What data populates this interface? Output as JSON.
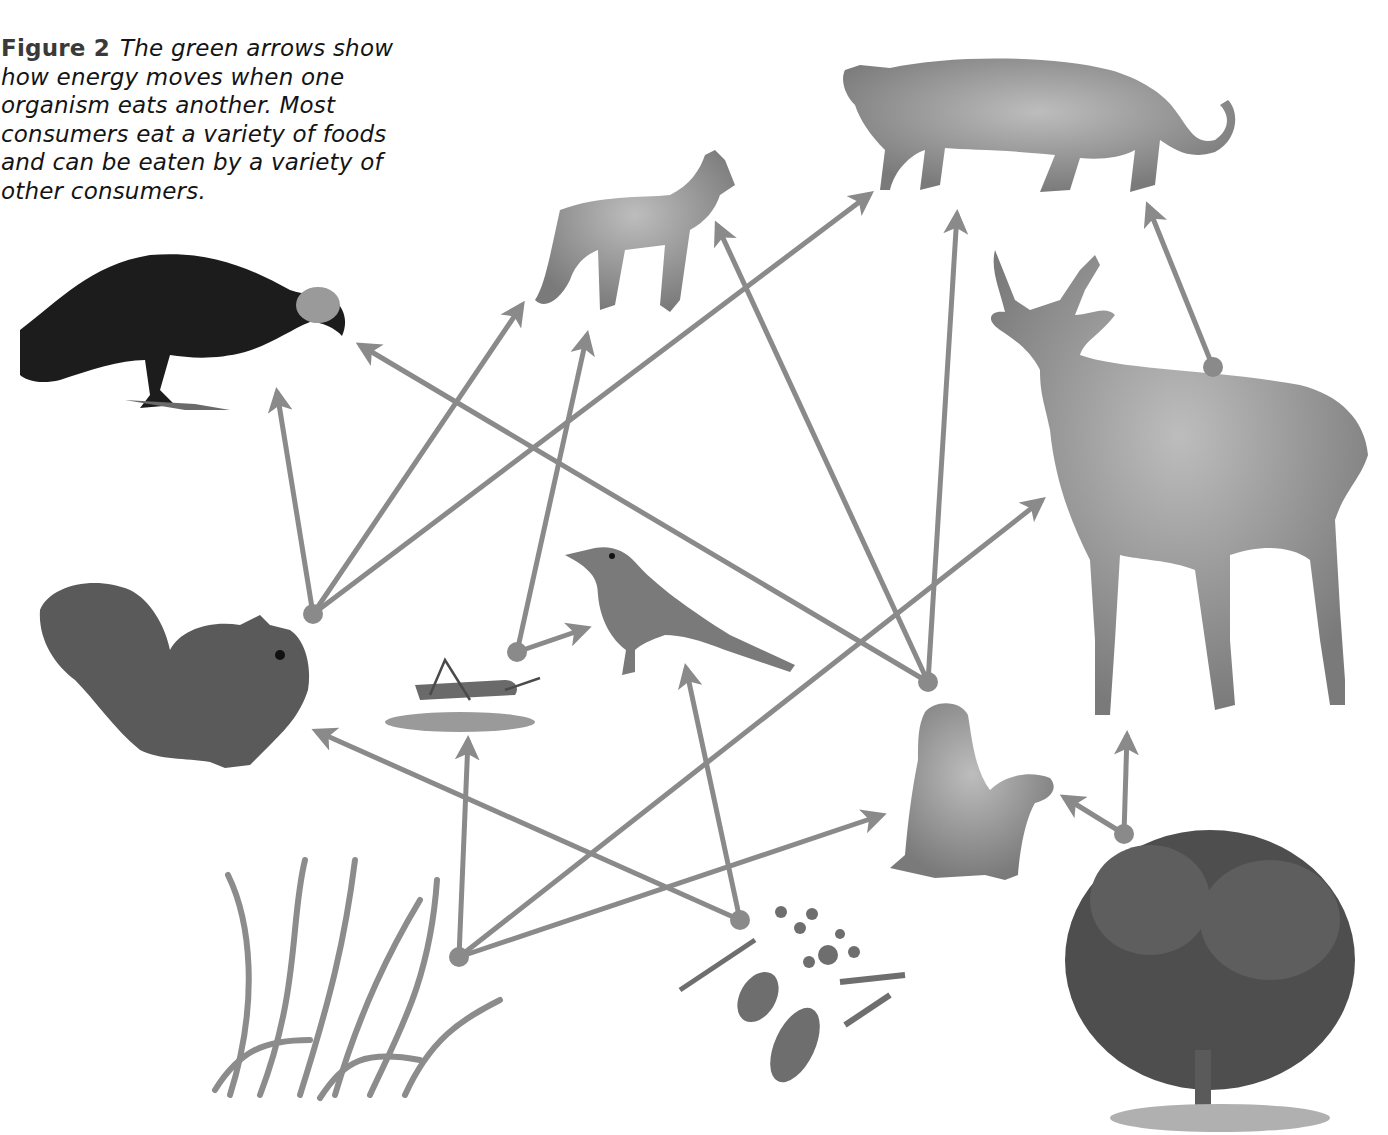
{
  "figure": {
    "label": "Figure 2",
    "caption": "The green arrows show how energy moves when one organism eats another. Most consumers eat a variety of foods and can be eaten by a variety of other consumers."
  },
  "colors": {
    "arrow": "#8a8a8a",
    "background": "#ffffff",
    "ink": "#141414"
  },
  "organisms": [
    {
      "id": "vulture",
      "name": "Vulture",
      "role": "consumer"
    },
    {
      "id": "fox",
      "name": "Fox",
      "role": "consumer"
    },
    {
      "id": "mountain-lion",
      "name": "Mountain lion",
      "role": "consumer"
    },
    {
      "id": "deer",
      "name": "Deer",
      "role": "consumer"
    },
    {
      "id": "squirrel",
      "name": "Squirrel",
      "role": "consumer"
    },
    {
      "id": "grasshopper",
      "name": "Grasshopper",
      "role": "consumer"
    },
    {
      "id": "bird",
      "name": "Bird",
      "role": "consumer"
    },
    {
      "id": "prairie-dog",
      "name": "Prairie dogs",
      "role": "consumer"
    },
    {
      "id": "grass",
      "name": "Grass",
      "role": "producer"
    },
    {
      "id": "seeds",
      "name": "Seeds",
      "role": "producer"
    },
    {
      "id": "shrub",
      "name": "Shrub",
      "role": "producer"
    }
  ],
  "energy_flows": [
    {
      "from": "squirrel",
      "to": "vulture"
    },
    {
      "from": "squirrel",
      "to": "fox"
    },
    {
      "from": "squirrel",
      "to": "mountain-lion"
    },
    {
      "from": "grasshopper",
      "to": "fox"
    },
    {
      "from": "grasshopper",
      "to": "bird"
    },
    {
      "from": "prairie-dog",
      "to": "vulture"
    },
    {
      "from": "prairie-dog",
      "to": "fox"
    },
    {
      "from": "prairie-dog",
      "to": "mountain-lion"
    },
    {
      "from": "deer",
      "to": "mountain-lion"
    },
    {
      "from": "grass",
      "to": "grasshopper"
    },
    {
      "from": "grass",
      "to": "deer"
    },
    {
      "from": "grass",
      "to": "prairie-dog"
    },
    {
      "from": "seeds",
      "to": "squirrel"
    },
    {
      "from": "seeds",
      "to": "bird"
    },
    {
      "from": "shrub",
      "to": "deer"
    },
    {
      "from": "shrub",
      "to": "prairie-dog"
    }
  ]
}
